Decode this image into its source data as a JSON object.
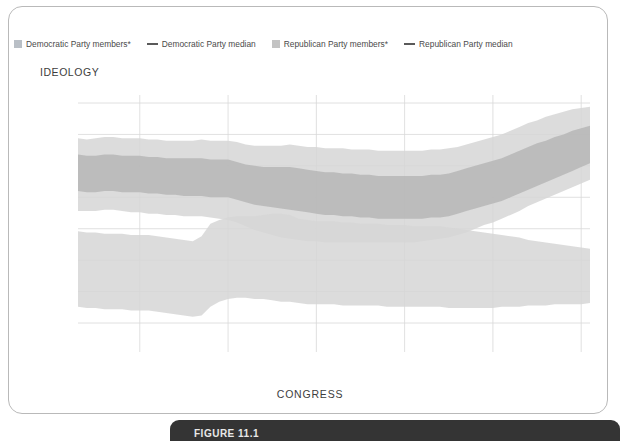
{
  "legend": {
    "items": [
      {
        "label": "Democratic Party members*",
        "type": "band",
        "color": "#b9bfc6"
      },
      {
        "label": "Democratic Party median",
        "type": "line",
        "color": "#5a5a5a"
      },
      {
        "label": "Republican Party members*",
        "type": "band",
        "color": "#c3c3c3"
      },
      {
        "label": "Republican Party median",
        "type": "line",
        "color": "#5a5a5a"
      }
    ]
  },
  "labels": {
    "ideology": "IDEOLOGY",
    "x_title": "CONGRESS",
    "y_top": "More conservative",
    "y_bottom": "More liberal",
    "arrow_up": "↑",
    "arrow_down": "↓"
  },
  "footer": {
    "caption": "FIGURE 11.1"
  },
  "chart_data": {
    "type": "area",
    "title": "IDEOLOGY",
    "xlabel": "CONGRESS",
    "ylabel": "",
    "ylim": [
      -0.85,
      1.05
    ],
    "xlim": [
      53,
      111
    ],
    "grid": true,
    "legend_position": "top",
    "yticks": [
      1.0,
      0.75,
      0.5,
      0.25,
      0,
      -0.25,
      -0.5,
      -0.75
    ],
    "ytick_labels": [
      "1.0",
      "0.75",
      "0.5",
      "0.25",
      "0",
      "-0.25",
      "-0.5",
      "-0.75"
    ],
    "xticks": [
      53,
      60,
      70,
      80,
      90,
      100,
      110
    ],
    "xtick_labels": [
      {
        "congress": "53rd",
        "years": "(1893–94)"
      },
      {
        "congress": "60th",
        "years": "(1907–08)"
      },
      {
        "congress": "70th",
        "years": "(1927–28)"
      },
      {
        "congress": "80th",
        "years": "(1947–48)"
      },
      {
        "congress": "90th",
        "years": "(1967–68)"
      },
      {
        "congress": "100th",
        "years": "(1987–88)"
      },
      {
        "congress": "110th",
        "years": "(2007–08)"
      }
    ],
    "x": [
      53,
      54,
      55,
      56,
      57,
      58,
      59,
      60,
      61,
      62,
      63,
      64,
      65,
      66,
      67,
      68,
      69,
      70,
      71,
      72,
      73,
      74,
      75,
      76,
      77,
      78,
      79,
      80,
      81,
      82,
      83,
      84,
      85,
      86,
      87,
      88,
      89,
      90,
      91,
      92,
      93,
      94,
      95,
      96,
      97,
      98,
      99,
      100,
      101,
      102,
      103,
      104,
      105,
      106,
      107,
      108,
      109,
      110,
      111
    ],
    "series": [
      {
        "name": "Republican Party median",
        "color": "#5a5a5a",
        "values": [
          0.45,
          0.44,
          0.44,
          0.45,
          0.45,
          0.44,
          0.44,
          0.44,
          0.43,
          0.43,
          0.42,
          0.42,
          0.41,
          0.41,
          0.41,
          0.4,
          0.4,
          0.4,
          0.38,
          0.36,
          0.34,
          0.33,
          0.32,
          0.31,
          0.3,
          0.29,
          0.28,
          0.27,
          0.26,
          0.26,
          0.25,
          0.25,
          0.24,
          0.24,
          0.23,
          0.23,
          0.23,
          0.22,
          0.22,
          0.22,
          0.23,
          0.23,
          0.24,
          0.26,
          0.28,
          0.3,
          0.32,
          0.34,
          0.36,
          0.39,
          0.42,
          0.46,
          0.49,
          0.52,
          0.55,
          0.58,
          0.61,
          0.64,
          0.67
        ]
      },
      {
        "name": "Democratic Party median",
        "color": "#5a5a5a",
        "values": [
          -0.32,
          -0.33,
          -0.33,
          -0.34,
          -0.34,
          -0.34,
          -0.35,
          -0.35,
          -0.35,
          -0.36,
          -0.37,
          -0.38,
          -0.39,
          -0.4,
          -0.38,
          -0.28,
          -0.25,
          -0.23,
          -0.22,
          -0.22,
          -0.22,
          -0.21,
          -0.21,
          -0.22,
          -0.23,
          -0.26,
          -0.27,
          -0.28,
          -0.28,
          -0.28,
          -0.29,
          -0.29,
          -0.3,
          -0.3,
          -0.3,
          -0.31,
          -0.31,
          -0.31,
          -0.32,
          -0.32,
          -0.32,
          -0.32,
          -0.33,
          -0.33,
          -0.34,
          -0.34,
          -0.34,
          -0.34,
          -0.34,
          -0.34,
          -0.35,
          -0.35,
          -0.35,
          -0.35,
          -0.35,
          -0.36,
          -0.36,
          -0.37,
          -0.37
        ]
      }
    ],
    "bands": [
      {
        "name": "Republican Party members* outer",
        "series": "Republican Party median",
        "color": "#d6d6d6",
        "opacity": 0.85,
        "upper": [
          0.72,
          0.71,
          0.72,
          0.73,
          0.73,
          0.72,
          0.72,
          0.72,
          0.71,
          0.71,
          0.7,
          0.7,
          0.7,
          0.7,
          0.71,
          0.7,
          0.7,
          0.7,
          0.69,
          0.67,
          0.66,
          0.66,
          0.66,
          0.66,
          0.67,
          0.66,
          0.65,
          0.65,
          0.64,
          0.64,
          0.64,
          0.63,
          0.63,
          0.63,
          0.62,
          0.62,
          0.62,
          0.62,
          0.62,
          0.62,
          0.63,
          0.63,
          0.64,
          0.65,
          0.67,
          0.69,
          0.71,
          0.73,
          0.75,
          0.78,
          0.81,
          0.84,
          0.86,
          0.89,
          0.91,
          0.93,
          0.95,
          0.96,
          0.97
        ],
        "lower": [
          0.14,
          0.14,
          0.14,
          0.15,
          0.15,
          0.14,
          0.13,
          0.13,
          0.12,
          0.12,
          0.11,
          0.11,
          0.1,
          0.1,
          0.1,
          0.09,
          0.08,
          0.07,
          0.05,
          0.02,
          -0.01,
          -0.03,
          -0.05,
          -0.07,
          -0.08,
          -0.09,
          -0.1,
          -0.1,
          -0.11,
          -0.11,
          -0.11,
          -0.11,
          -0.11,
          -0.11,
          -0.11,
          -0.11,
          -0.11,
          -0.11,
          -0.11,
          -0.1,
          -0.09,
          -0.08,
          -0.07,
          -0.05,
          -0.03,
          0.0,
          0.03,
          0.05,
          0.08,
          0.11,
          0.14,
          0.18,
          0.21,
          0.24,
          0.27,
          0.3,
          0.33,
          0.36,
          0.39
        ]
      },
      {
        "name": "Republican Party members* inner",
        "series": "Republican Party median",
        "color": "#b6b6b6",
        "opacity": 0.85,
        "upper": [
          0.59,
          0.58,
          0.58,
          0.59,
          0.59,
          0.58,
          0.58,
          0.58,
          0.57,
          0.57,
          0.56,
          0.56,
          0.56,
          0.56,
          0.56,
          0.55,
          0.55,
          0.55,
          0.53,
          0.51,
          0.5,
          0.49,
          0.49,
          0.49,
          0.49,
          0.48,
          0.47,
          0.46,
          0.45,
          0.45,
          0.44,
          0.44,
          0.43,
          0.43,
          0.42,
          0.42,
          0.42,
          0.42,
          0.42,
          0.42,
          0.43,
          0.43,
          0.44,
          0.46,
          0.48,
          0.5,
          0.52,
          0.54,
          0.56,
          0.59,
          0.62,
          0.65,
          0.68,
          0.7,
          0.73,
          0.75,
          0.78,
          0.8,
          0.82
        ],
        "lower": [
          0.3,
          0.29,
          0.29,
          0.3,
          0.3,
          0.29,
          0.29,
          0.29,
          0.28,
          0.28,
          0.27,
          0.27,
          0.26,
          0.26,
          0.26,
          0.25,
          0.25,
          0.25,
          0.23,
          0.21,
          0.19,
          0.18,
          0.17,
          0.16,
          0.15,
          0.14,
          0.13,
          0.12,
          0.11,
          0.11,
          0.1,
          0.1,
          0.09,
          0.09,
          0.08,
          0.08,
          0.08,
          0.08,
          0.08,
          0.08,
          0.09,
          0.09,
          0.1,
          0.12,
          0.14,
          0.16,
          0.18,
          0.2,
          0.22,
          0.25,
          0.28,
          0.31,
          0.34,
          0.37,
          0.4,
          0.43,
          0.46,
          0.49,
          0.52
        ]
      },
      {
        "name": "Democratic Party members* outer",
        "series": "Democratic Party median",
        "color": "#d6d6d6",
        "opacity": 0.85,
        "upper": [
          -0.02,
          -0.03,
          -0.03,
          -0.04,
          -0.04,
          -0.04,
          -0.05,
          -0.05,
          -0.05,
          -0.06,
          -0.07,
          -0.08,
          -0.09,
          -0.1,
          -0.06,
          0.04,
          0.07,
          0.09,
          0.1,
          0.1,
          0.1,
          0.11,
          0.12,
          0.12,
          0.11,
          0.08,
          0.07,
          0.06,
          0.06,
          0.06,
          0.05,
          0.05,
          0.04,
          0.04,
          0.04,
          0.03,
          0.03,
          0.03,
          0.02,
          0.02,
          0.02,
          0.02,
          0.01,
          0.0,
          -0.01,
          -0.02,
          -0.03,
          -0.04,
          -0.05,
          -0.06,
          -0.07,
          -0.09,
          -0.1,
          -0.11,
          -0.12,
          -0.13,
          -0.14,
          -0.15,
          -0.16
        ],
        "lower": [
          -0.62,
          -0.63,
          -0.63,
          -0.64,
          -0.64,
          -0.64,
          -0.65,
          -0.65,
          -0.65,
          -0.66,
          -0.67,
          -0.68,
          -0.69,
          -0.7,
          -0.69,
          -0.62,
          -0.58,
          -0.56,
          -0.55,
          -0.55,
          -0.56,
          -0.56,
          -0.57,
          -0.58,
          -0.58,
          -0.59,
          -0.6,
          -0.6,
          -0.6,
          -0.6,
          -0.61,
          -0.61,
          -0.61,
          -0.61,
          -0.61,
          -0.62,
          -0.62,
          -0.62,
          -0.62,
          -0.62,
          -0.62,
          -0.62,
          -0.63,
          -0.63,
          -0.63,
          -0.63,
          -0.63,
          -0.63,
          -0.62,
          -0.62,
          -0.62,
          -0.61,
          -0.61,
          -0.61,
          -0.6,
          -0.6,
          -0.6,
          -0.6,
          -0.59
        ]
      },
      {
        "name": "Democratic Party members* inner",
        "series": "Democratic Party median",
        "color": "#b6b6b6",
        "opacity": 0.85,
        "upper": [
          -0.17,
          -0.18,
          -0.18,
          -0.19,
          -0.19,
          -0.19,
          -0.2,
          -0.2,
          -0.2,
          -0.21,
          -0.22,
          -0.23,
          -0.24,
          -0.25,
          -0.22,
          -0.12,
          -0.09,
          -0.07,
          -0.06,
          -0.06,
          -0.06,
          -0.05,
          -0.05,
          -0.06,
          -0.07,
          -0.1,
          -0.11,
          -0.12,
          -0.12,
          -0.12,
          -0.13,
          -0.13,
          -0.14,
          -0.14,
          -0.14,
          -0.15,
          -0.15,
          -0.15,
          -0.16,
          -0.16,
          -0.16,
          -0.16,
          -0.17,
          -0.17,
          -0.18,
          -0.18,
          -0.18,
          -0.19,
          -0.19,
          -0.19,
          -0.2,
          -0.2,
          -0.21,
          -0.21,
          -0.21,
          -0.22,
          -0.22,
          -0.23,
          -0.23
        ]
      }
    ]
  }
}
